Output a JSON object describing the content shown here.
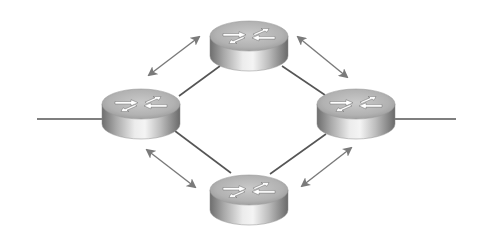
{
  "diagram": {
    "title": "Four routers in a ring topology with bidirectional exchange between neighbors",
    "colors": {
      "background": "#ffffff",
      "link_line": "#555555",
      "exchange_arrow": "#7a7a7a",
      "router_top": "#b4b4b4",
      "router_body_dark": "#6e6e6e",
      "router_body_light": "#e6e6e6",
      "router_glyph": "#ffffff"
    },
    "routers": [
      {
        "id": "router-top",
        "cx": 249,
        "cy": 36,
        "rx": 39,
        "ry": 15,
        "height": 20
      },
      {
        "id": "router-left",
        "cx": 141,
        "cy": 104,
        "rx": 39,
        "ry": 15,
        "height": 20
      },
      {
        "id": "router-right",
        "cx": 356,
        "cy": 104,
        "rx": 39,
        "ry": 15,
        "height": 20
      },
      {
        "id": "router-bottom",
        "cx": 249,
        "cy": 190,
        "rx": 39,
        "ry": 15,
        "height": 20
      }
    ],
    "links": [
      {
        "id": "link-top-left",
        "from": "router-top",
        "to": "router-left",
        "x1": 220,
        "y1": 66,
        "x2": 179,
        "y2": 96
      },
      {
        "id": "link-top-right",
        "from": "router-top",
        "to": "router-right",
        "x1": 282,
        "y1": 66,
        "x2": 325,
        "y2": 95
      },
      {
        "id": "link-left-bottom",
        "from": "router-left",
        "to": "router-bottom",
        "x1": 175,
        "y1": 131,
        "x2": 231,
        "y2": 173
      },
      {
        "id": "link-right-bottom",
        "from": "router-right",
        "to": "router-bottom",
        "x1": 326,
        "y1": 134,
        "x2": 270,
        "y2": 174
      }
    ],
    "external_links": [
      {
        "id": "external-left",
        "x1": 37,
        "y1": 119,
        "x2": 102,
        "y2": 119
      },
      {
        "id": "external-right",
        "x1": 394,
        "y1": 119,
        "x2": 456,
        "y2": 119
      }
    ],
    "exchange_arrows": [
      {
        "id": "arrow-top-left",
        "between": [
          "router-left",
          "router-top"
        ],
        "x1": 149,
        "y1": 75,
        "x2": 199,
        "y2": 37
      },
      {
        "id": "arrow-top-right",
        "between": [
          "router-top",
          "router-right"
        ],
        "x1": 298,
        "y1": 37,
        "x2": 347,
        "y2": 77
      },
      {
        "id": "arrow-bottom-left",
        "between": [
          "router-left",
          "router-bottom"
        ],
        "x1": 147,
        "y1": 150,
        "x2": 195,
        "y2": 187
      },
      {
        "id": "arrow-bottom-right",
        "between": [
          "router-bottom",
          "router-right"
        ],
        "x1": 302,
        "y1": 186,
        "x2": 351,
        "y2": 148
      }
    ],
    "icons": {
      "router": "router-icon",
      "bidirectional_arrow": "double-arrow-icon"
    }
  }
}
